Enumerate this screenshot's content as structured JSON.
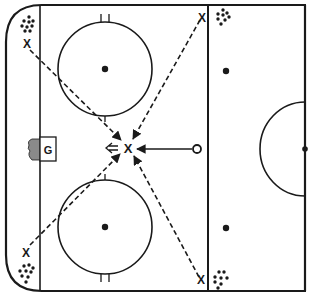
{
  "diagram": {
    "colors": {
      "line": "#1a1a1a",
      "background": "#ffffff",
      "crease": "#8a8a8a"
    },
    "goalie": {
      "label": "G"
    },
    "players": [
      {
        "id": "top-left-corner",
        "label": "X"
      },
      {
        "id": "top-blueline",
        "label": "X"
      },
      {
        "id": "bottom-left-corner",
        "label": "X"
      },
      {
        "id": "bottom-blueline",
        "label": "X"
      },
      {
        "id": "center-slot",
        "label": "X"
      }
    ],
    "puck_start": {
      "label": "O"
    },
    "legend": {
      "dashed_arrow": "pass",
      "solid_arrow": "skate",
      "double_arrow": "shot",
      "dot_cluster": "pucks"
    }
  }
}
